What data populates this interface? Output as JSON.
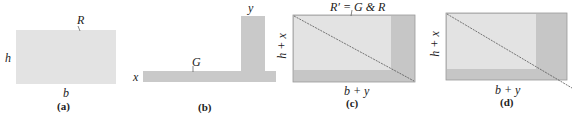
{
  "colors": {
    "light": "#e3e3e3",
    "mid": "#c9c9c9",
    "dark": "#b3b3b3",
    "edge": "#9a9a9a",
    "line": "#555555"
  },
  "panels": [
    {
      "id": "a",
      "caption": "(a)",
      "region_label": "R",
      "side_label": "h",
      "bottom_label": "b"
    },
    {
      "id": "b",
      "caption": "(b)",
      "region_label": "G",
      "left_label": "x",
      "top_label": "y"
    },
    {
      "id": "c",
      "caption": "(c)",
      "region_label": "R′ = G & R",
      "side_label": "h + x",
      "bottom_label": "b + y"
    },
    {
      "id": "d",
      "caption": "(d)",
      "side_label": "h + x",
      "bottom_label": "b + y"
    }
  ]
}
